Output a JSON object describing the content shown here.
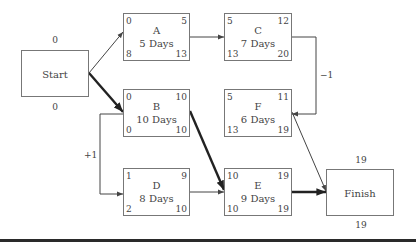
{
  "diagram": {
    "type": "precedence network (activity-on-node) with lags",
    "start": {
      "label": "Start",
      "top_value": "0",
      "bottom_value": "0"
    },
    "finish": {
      "label": "Finish",
      "top_value": "19",
      "bottom_value": "19"
    },
    "activities": [
      {
        "id": "A",
        "duration": "5 Days",
        "es": "0",
        "ef": "5",
        "ls": "8",
        "lf": "13"
      },
      {
        "id": "B",
        "duration": "10 Days",
        "es": "0",
        "ef": "10",
        "ls": "0",
        "lf": "10"
      },
      {
        "id": "C",
        "duration": "7 Days",
        "es": "5",
        "ef": "12",
        "ls": "13",
        "lf": "20"
      },
      {
        "id": "D",
        "duration": "8 Days",
        "es": "1",
        "ef": "9",
        "ls": "2",
        "lf": "10"
      },
      {
        "id": "E",
        "duration": "9 Days",
        "es": "10",
        "ef": "19",
        "ls": "10",
        "lf": "19"
      },
      {
        "id": "F",
        "duration": "6 Days",
        "es": "5",
        "ef": "11",
        "ls": "13",
        "lf": "19"
      }
    ],
    "lags": [
      {
        "from": "C",
        "to": "F",
        "label": "−1"
      },
      {
        "from": "B",
        "to": "D",
        "label": "+1"
      }
    ],
    "links": [
      {
        "from": "Start",
        "to": "A",
        "critical": false
      },
      {
        "from": "Start",
        "to": "B",
        "critical": true
      },
      {
        "from": "A",
        "to": "C",
        "critical": false
      },
      {
        "from": "C",
        "to": "F",
        "critical": false
      },
      {
        "from": "B",
        "to": "D",
        "critical": false
      },
      {
        "from": "B",
        "to": "E",
        "critical": true
      },
      {
        "from": "D",
        "to": "E",
        "critical": false
      },
      {
        "from": "F",
        "to": "Finish",
        "critical": false
      },
      {
        "from": "E",
        "to": "Finish",
        "critical": true
      }
    ],
    "colors": {
      "line": "#444444",
      "critical_line": "#222222",
      "box_border": "#777777"
    }
  }
}
